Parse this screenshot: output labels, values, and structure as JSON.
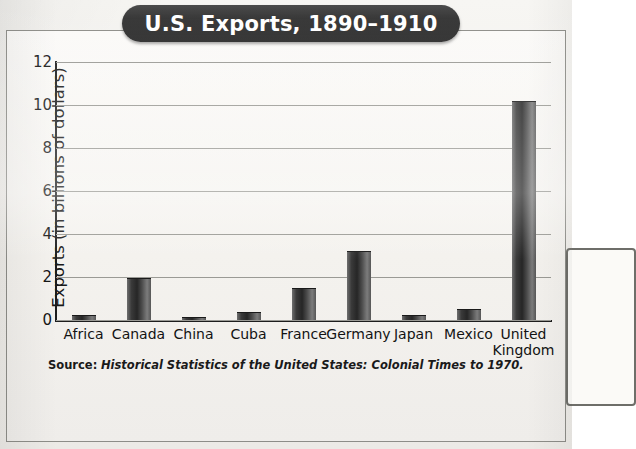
{
  "title": "U.S. Exports, 1890–1910",
  "source": {
    "label": "Source:",
    "citation": "Historical Statistics of the United States: Colonial Times to 1970."
  },
  "colors": {
    "banner": "#2b2b2b",
    "banner_text": "#ffffff",
    "bar": "#262626",
    "gridline": "#9a9a95",
    "axis": "#1d1d1d",
    "page": "#f2f1ee"
  },
  "chart_data": {
    "type": "bar",
    "title": "U.S. Exports, 1890–1910",
    "xlabel": "",
    "ylabel": "Exports (in billions of dollars)",
    "categories": [
      "Africa",
      "Canada",
      "China",
      "Cuba",
      "France",
      "Germany",
      "Japan",
      "Mexico",
      "United Kingdom"
    ],
    "values": [
      0.25,
      1.95,
      0.15,
      0.35,
      1.5,
      3.2,
      0.25,
      0.5,
      10.2
    ],
    "ylim": [
      0,
      12
    ],
    "yticks": [
      0,
      2,
      4,
      6,
      8,
      10,
      12
    ],
    "ytick_labels": [
      "0",
      "2",
      "4",
      "6",
      "8",
      "10",
      "12"
    ],
    "grid": true,
    "legend": false
  }
}
